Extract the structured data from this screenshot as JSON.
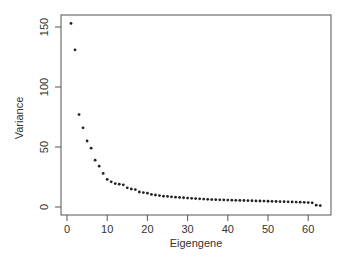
{
  "chart_data": {
    "type": "scatter",
    "title": "",
    "xlabel": "Eigengene",
    "ylabel": "Variance",
    "xlim": [
      -1,
      65
    ],
    "ylim": [
      0,
      160
    ],
    "x_ticks": [
      0,
      10,
      20,
      30,
      40,
      50,
      60
    ],
    "y_ticks": [
      0,
      50,
      100,
      150
    ],
    "grid": false,
    "legend": null,
    "series": [
      {
        "name": "Variance",
        "x": [
          1,
          2,
          3,
          4,
          5,
          6,
          7,
          8,
          9,
          10,
          11,
          12,
          13,
          14,
          15,
          16,
          17,
          18,
          19,
          20,
          21,
          22,
          23,
          24,
          25,
          26,
          27,
          28,
          29,
          30,
          31,
          32,
          33,
          34,
          35,
          36,
          37,
          38,
          39,
          40,
          41,
          42,
          43,
          44,
          45,
          46,
          47,
          48,
          49,
          50,
          51,
          52,
          53,
          54,
          55,
          56,
          57,
          58,
          59,
          60,
          61,
          62,
          63
        ],
        "values": [
          153,
          131,
          77,
          66,
          55,
          49,
          39,
          34,
          28,
          23,
          21,
          19.5,
          19,
          18.5,
          16,
          15,
          14.5,
          12.5,
          12,
          11.5,
          10.5,
          10,
          9.5,
          9,
          8.8,
          8.5,
          8.2,
          8,
          7.7,
          7.4,
          7.2,
          7,
          6.8,
          6.6,
          6.4,
          6.2,
          6.1,
          6,
          5.9,
          5.8,
          5.7,
          5.6,
          5.5,
          5.4,
          5.3,
          5.2,
          5.1,
          5,
          4.9,
          4.8,
          4.7,
          4.6,
          4.5,
          4.4,
          4.3,
          4.2,
          4.1,
          4,
          3.9,
          3.7,
          3.5,
          1.5,
          1.2
        ]
      }
    ]
  },
  "axes": {
    "x_title": "Eigengene",
    "y_title": "Variance",
    "x_tick_labels": [
      "0",
      "10",
      "20",
      "30",
      "40",
      "50",
      "60"
    ],
    "y_tick_labels": [
      "0",
      "50",
      "100",
      "150"
    ]
  },
  "colors": {
    "points": "#222222",
    "axis": "#555555"
  }
}
